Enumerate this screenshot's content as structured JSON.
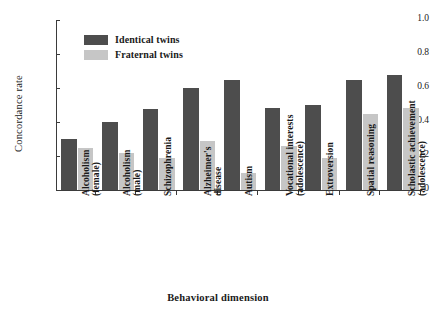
{
  "chart_data": {
    "type": "bar",
    "title": "",
    "xlabel": "Behavioral dimension",
    "ylabel": "Concordance rate",
    "ylim": [
      0,
      1.0
    ],
    "ytick_labels": [
      "0",
      "0.2",
      "0.4",
      "0.6",
      "0.8",
      "1.0"
    ],
    "ytick_values": [
      0,
      0.2,
      0.4,
      0.6,
      0.8,
      1.0
    ],
    "grid": false,
    "legend_position": "upper-left-inside",
    "categories": [
      {
        "line1": "Alcoholism",
        "line2": "(female)"
      },
      {
        "line1": "Alcoholism",
        "line2": "(male)"
      },
      {
        "line1": "Schizophrenia",
        "line2": ""
      },
      {
        "line1": "Alzheimer's",
        "line2": "disease"
      },
      {
        "line1": "Autism",
        "line2": ""
      },
      {
        "line1": "Vocational interests",
        "line2": "(adolescence)"
      },
      {
        "line1": "Extroversion",
        "line2": ""
      },
      {
        "line1": "Spatial reasoning",
        "line2": ""
      },
      {
        "line1": "Scholastic achievement",
        "line2": "(adolescence)"
      }
    ],
    "series": [
      {
        "name": "Identical twins",
        "color": "#4d4d4d",
        "values": [
          0.3,
          0.4,
          0.475,
          0.6,
          0.645,
          0.485,
          0.5,
          0.65,
          0.675
        ]
      },
      {
        "name": "Fraternal twins",
        "color": "#c6c6c6",
        "values": [
          0.25,
          0.22,
          0.19,
          0.29,
          0.1,
          0.26,
          0.19,
          0.45,
          0.485
        ]
      }
    ]
  }
}
